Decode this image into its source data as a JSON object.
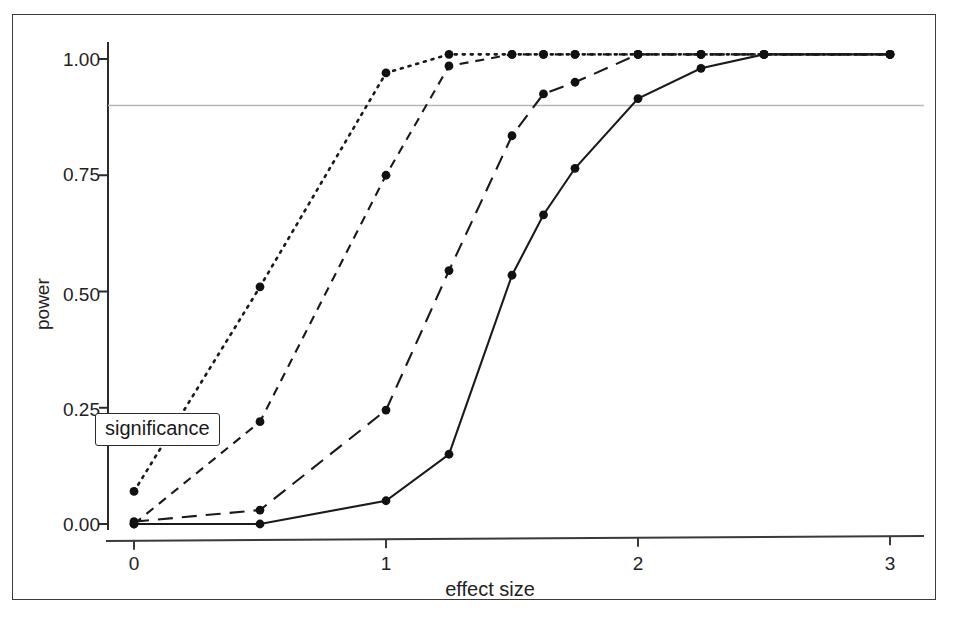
{
  "figure": {
    "title": "",
    "background": "#ffffff",
    "border_color": "#3b3b3b"
  },
  "axes": {
    "x_label": "effect size",
    "y_label": "power",
    "x_ticks": [
      "0",
      "1",
      "2",
      "3"
    ],
    "y_ticks": [
      "0.00",
      "0.25",
      "0.50",
      "0.75",
      "1.00"
    ]
  },
  "annotations": {
    "significance_label": "significance"
  },
  "chart_data": {
    "type": "line",
    "title": "",
    "xlabel": "effect size",
    "ylabel": "power",
    "xlim": [
      -0.18,
      3.22
    ],
    "ylim": [
      -0.03,
      1.05
    ],
    "xticks": [
      0,
      1,
      2,
      3
    ],
    "yticks": [
      0.0,
      0.25,
      0.5,
      0.75,
      1.0
    ],
    "xticklabels": [
      "0",
      "1",
      "2",
      "3"
    ],
    "yticklabels": [
      "0.00",
      "0.25",
      "0.50",
      "0.75",
      "1.00"
    ],
    "grid": false,
    "legend": "none",
    "line_color": "#1a1a1a",
    "marker": "circle",
    "marker_color": "#111111",
    "annotations": [
      {
        "text": "significance",
        "type": "boxed-label",
        "x": 0.0,
        "y": 0.205
      }
    ],
    "reference_lines": [
      {
        "name": "significance-threshold",
        "orientation": "horizontal",
        "y": 0.9,
        "color": "#b6b6b6",
        "style": "solid"
      }
    ],
    "series": [
      {
        "name": "curve-1",
        "style": "dotted",
        "x": [
          0.0,
          0.5,
          1.0,
          1.25,
          1.5,
          1.625,
          1.75,
          2.0,
          2.25,
          2.5,
          3.0
        ],
        "values": [
          0.07,
          0.51,
          0.97,
          1.01,
          1.01,
          1.01,
          1.01,
          1.01,
          1.01,
          1.01,
          1.01
        ]
      },
      {
        "name": "curve-2",
        "style": "dashed-short",
        "x": [
          0.0,
          0.5,
          1.0,
          1.25,
          1.5,
          1.625,
          1.75,
          2.0,
          2.25,
          2.5,
          3.0
        ],
        "values": [
          0.0,
          0.22,
          0.75,
          0.985,
          1.01,
          1.01,
          1.01,
          1.01,
          1.01,
          1.01,
          1.01
        ]
      },
      {
        "name": "curve-3",
        "style": "dashed-long",
        "x": [
          0.0,
          0.5,
          1.0,
          1.25,
          1.5,
          1.625,
          1.75,
          2.0,
          2.25,
          2.5,
          3.0
        ],
        "values": [
          0.005,
          0.03,
          0.245,
          0.545,
          0.835,
          0.925,
          0.95,
          1.01,
          1.01,
          1.01,
          1.01
        ]
      },
      {
        "name": "curve-4",
        "style": "solid",
        "x": [
          0.0,
          0.5,
          1.0,
          1.25,
          1.5,
          1.625,
          1.75,
          2.0,
          2.25,
          2.5,
          3.0
        ],
        "values": [
          0.0,
          0.0,
          0.05,
          0.15,
          0.535,
          0.665,
          0.765,
          0.915,
          0.98,
          1.01,
          1.01
        ]
      }
    ]
  }
}
